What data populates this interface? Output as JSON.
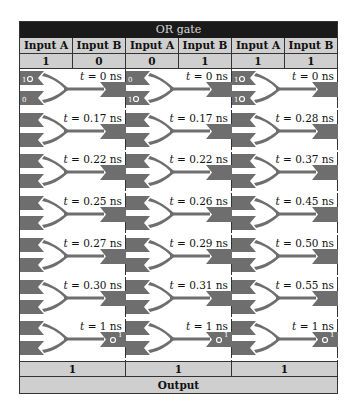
{
  "title": "OR gate",
  "columns": [
    {
      "header_a": "Input A",
      "header_b": "Input B",
      "value_a": "1",
      "value_b": "0",
      "steps": [
        {
          "t": "0",
          "unit": "ns",
          "in_a": "1",
          "in_b": "0",
          "out": ""
        },
        {
          "t": "0.17",
          "unit": "ns"
        },
        {
          "t": "0.22",
          "unit": "ns"
        },
        {
          "t": "0.25",
          "unit": "ns"
        },
        {
          "t": "0.27",
          "unit": "ns"
        },
        {
          "t": "0.30",
          "unit": "ns"
        },
        {
          "t": "1",
          "unit": "ns",
          "out": "1"
        }
      ],
      "output": "1"
    },
    {
      "header_a": "Input A",
      "header_b": "Input B",
      "value_a": "0",
      "value_b": "1",
      "steps": [
        {
          "t": "0",
          "unit": "ns",
          "in_a": "0",
          "in_b": "1",
          "out": ""
        },
        {
          "t": "0.17",
          "unit": "ns"
        },
        {
          "t": "0.22",
          "unit": "ns"
        },
        {
          "t": "0.26",
          "unit": "ns"
        },
        {
          "t": "0.29",
          "unit": "ns"
        },
        {
          "t": "0.31",
          "unit": "ns"
        },
        {
          "t": "1",
          "unit": "ns",
          "out": "1"
        }
      ],
      "output": "1"
    },
    {
      "header_a": "Input A",
      "header_b": "Input B",
      "value_a": "1",
      "value_b": "1",
      "steps": [
        {
          "t": "0",
          "unit": "ns",
          "in_a": "1",
          "in_b": "1",
          "out": ""
        },
        {
          "t": "0.28",
          "unit": "ns"
        },
        {
          "t": "0.37",
          "unit": "ns"
        },
        {
          "t": "0.45",
          "unit": "ns"
        },
        {
          "t": "0.50",
          "unit": "ns"
        },
        {
          "t": "0.55",
          "unit": "ns"
        },
        {
          "t": "1",
          "unit": "ns",
          "out": "1"
        }
      ],
      "output": "1"
    }
  ],
  "footer": "Output",
  "colors": {
    "gate": "#6e6e6e",
    "title_bg": "#1a1a1a",
    "cell_bg": "#cfcfcf"
  }
}
